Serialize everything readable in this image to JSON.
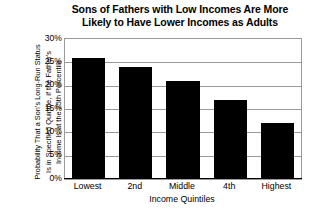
{
  "chart_data": {
    "type": "bar",
    "title": "Sons of Fathers with Low Incomes Are More Likely to Have Lower Incomes as Adults",
    "title_lines": [
      "Sons of Fathers with Low Incomes Are More",
      "Likely to Have Lower Incomes as Adults"
    ],
    "categories": [
      "Lowest",
      "2nd",
      "Middle",
      "4th",
      "Highest"
    ],
    "values": [
      26,
      24,
      21,
      17,
      12
    ],
    "value_labels": [
      "26%",
      "24%",
      "21%",
      "17%",
      "12%"
    ],
    "xlabel": "Income Quintiles",
    "ylabel": "Probability That a Son's Long-Run Status Is in Specified Quintile, if the Father's Income Is at the 25th Percentile",
    "ylabel_lines": [
      "Probability That a Son's Long-Run Status",
      "Is in Specified Quintile, if the Father's",
      "Income Is at the 25th Percentile"
    ],
    "ylim": [
      0,
      30
    ],
    "ytick_values": [
      30,
      25,
      20,
      15,
      10,
      5,
      0
    ],
    "ytick_labels": [
      "30%",
      "25%",
      "20%",
      "15%",
      "10%",
      "5%",
      "0%"
    ],
    "grid": true,
    "legend": "none",
    "bar_color": "#000000",
    "grid_color": "#9a9a9a",
    "axis_color": "#000000",
    "background_color": "#ffffff"
  }
}
